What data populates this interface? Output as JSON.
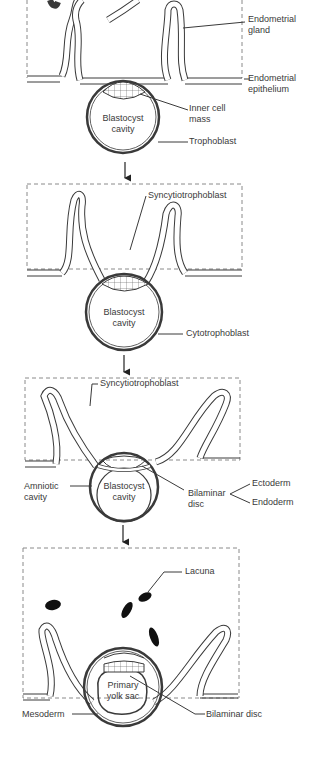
{
  "panels": [
    {
      "id": "stage-1",
      "labels": {
        "endometrial_gland": [
          "Endometrial",
          "gland"
        ],
        "endometrial_epithelium": [
          "Endometrial",
          "epithelium"
        ],
        "inner_cell_mass": [
          "Inner cell",
          "mass"
        ],
        "blastocyst_cavity": [
          "Blastocyst",
          "cavity"
        ],
        "trophoblast": "Trophoblast"
      }
    },
    {
      "id": "stage-2",
      "labels": {
        "syncytiotrophoblast": "Syncytiotrophoblast",
        "blastocyst_cavity": [
          "Blastocyst",
          "cavity"
        ],
        "cytotrophoblast": "Cytotrophoblast"
      }
    },
    {
      "id": "stage-3",
      "labels": {
        "syncytiotrophoblast": "Syncytiotrophoblast",
        "amniotic_cavity": [
          "Amniotic",
          "cavity"
        ],
        "blastocyst_cavity": [
          "Blastocyst",
          "cavity"
        ],
        "bilaminar_disc": [
          "Bilaminar",
          "disc"
        ],
        "ectoderm": "Ectoderm",
        "endoderm": "Endoderm"
      }
    },
    {
      "id": "stage-4",
      "labels": {
        "lacuna": "Lacuna",
        "primary_yolk_sac": [
          "Primary",
          "yolk sac"
        ],
        "mesoderm": "Mesoderm",
        "bilaminar_disc": "Bilaminar disc"
      }
    }
  ],
  "arrows": [
    "down",
    "down",
    "down"
  ],
  "colors": {
    "line": "#3a3a3a",
    "dashed_box": "#8a8a8a",
    "lacuna_fill": "#111111",
    "background": "#ffffff"
  }
}
